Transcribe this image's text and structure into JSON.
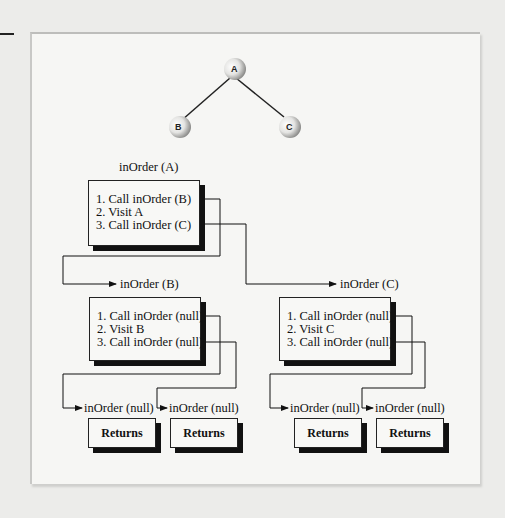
{
  "tree": {
    "nodes": [
      {
        "id": "A",
        "label": "A"
      },
      {
        "id": "B",
        "label": "B"
      },
      {
        "id": "C",
        "label": "C"
      }
    ],
    "edges": [
      [
        "A",
        "B"
      ],
      [
        "A",
        "C"
      ]
    ]
  },
  "calls": {
    "a": {
      "caption": "inOrder (A)",
      "steps": [
        "1. Call inOrder (B)",
        "2. Visit A",
        "3. Call inOrder (C)"
      ]
    },
    "b": {
      "caption": "inOrder (B)",
      "steps": [
        "1. Call inOrder (null)",
        "2. Visit B",
        "3. Call inOrder (null)"
      ]
    },
    "c": {
      "caption": "inOrder (C)",
      "steps": [
        "1. Call inOrder (null)",
        "2. Visit C",
        "3. Call inOrder (null)"
      ]
    }
  },
  "null_calls": [
    {
      "caption": "inOrder (null)",
      "result": "Returns"
    },
    {
      "caption": "inOrder (null)",
      "result": "Returns"
    },
    {
      "caption": "inOrder (null)",
      "result": "Returns"
    },
    {
      "caption": "inOrder (null)",
      "result": "Returns"
    }
  ]
}
